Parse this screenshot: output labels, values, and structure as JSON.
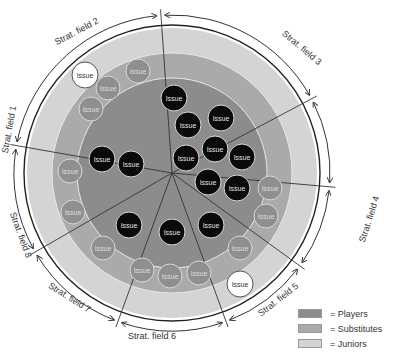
{
  "diagram": {
    "center": [
      172,
      173
    ],
    "rings": {
      "juniors_radius": 145,
      "substitutes_radius": 120,
      "players_radius": 95,
      "border_radius": 148,
      "arrow_radius": 158
    },
    "colors": {
      "players": "#8c8c8c",
      "substitutes": "#aaaaaa",
      "juniors": "#d4d4d4",
      "issue_player": "#0a0a0a",
      "issue_substitute": "#8f8f8f",
      "issue_junior": "#ffffff",
      "lines": "#333333"
    },
    "divider_angles_deg": [
      -94,
      -28,
      5,
      36,
      70,
      110,
      150,
      190
    ],
    "fields": [
      {
        "label": "Strat. field 1",
        "x": 12,
        "y": 130,
        "rotate": -80
      },
      {
        "label": "Strat. field 2",
        "x": 78,
        "y": 34,
        "rotate": -28
      },
      {
        "label": "Strat. field 3",
        "x": 300,
        "y": 50,
        "rotate": 40
      },
      {
        "label": "Strat. field 4",
        "x": 372,
        "y": 220,
        "rotate": -72
      },
      {
        "label": "Strat. field 5",
        "x": 280,
        "y": 302,
        "rotate": -38
      },
      {
        "label": "Strat. field 6",
        "x": 152,
        "y": 339,
        "rotate": 0
      },
      {
        "label": "Strat. field 7",
        "x": 68,
        "y": 300,
        "rotate": 32
      },
      {
        "label": "Strat. field 8",
        "x": 18,
        "y": 236,
        "rotate": 70
      }
    ],
    "issue_label": "Issue",
    "issues": [
      {
        "type": "junior",
        "x": 85,
        "y": 75,
        "r": 13
      },
      {
        "type": "substitute",
        "x": 108,
        "y": 88,
        "r": 12
      },
      {
        "type": "substitute",
        "x": 138,
        "y": 71,
        "r": 12
      },
      {
        "type": "substitute",
        "x": 91,
        "y": 109,
        "r": 12
      },
      {
        "type": "substitute",
        "x": 70,
        "y": 171,
        "r": 12
      },
      {
        "type": "substitute",
        "x": 73,
        "y": 212,
        "r": 12
      },
      {
        "type": "substitute",
        "x": 103,
        "y": 248,
        "r": 12
      },
      {
        "type": "substitute",
        "x": 142,
        "y": 270,
        "r": 12
      },
      {
        "type": "substitute",
        "x": 170,
        "y": 276,
        "r": 12
      },
      {
        "type": "substitute",
        "x": 199,
        "y": 273,
        "r": 12
      },
      {
        "type": "substitute",
        "x": 270,
        "y": 188,
        "r": 12
      },
      {
        "type": "substitute",
        "x": 266,
        "y": 216,
        "r": 12
      },
      {
        "type": "substitute",
        "x": 240,
        "y": 248,
        "r": 12
      },
      {
        "type": "junior",
        "x": 240,
        "y": 284,
        "r": 13
      },
      {
        "type": "player",
        "x": 174,
        "y": 98,
        "r": 13
      },
      {
        "type": "player",
        "x": 188,
        "y": 125,
        "r": 13
      },
      {
        "type": "player",
        "x": 221,
        "y": 118,
        "r": 13
      },
      {
        "type": "player",
        "x": 186,
        "y": 158,
        "r": 13
      },
      {
        "type": "player",
        "x": 215,
        "y": 149,
        "r": 13
      },
      {
        "type": "player",
        "x": 242,
        "y": 157,
        "r": 13
      },
      {
        "type": "player",
        "x": 208,
        "y": 182,
        "r": 13
      },
      {
        "type": "player",
        "x": 237,
        "y": 188,
        "r": 13
      },
      {
        "type": "player",
        "x": 102,
        "y": 159,
        "r": 13
      },
      {
        "type": "player",
        "x": 131,
        "y": 164,
        "r": 13
      },
      {
        "type": "player",
        "x": 129,
        "y": 225,
        "r": 13
      },
      {
        "type": "player",
        "x": 172,
        "y": 232,
        "r": 13
      },
      {
        "type": "player",
        "x": 211,
        "y": 225,
        "r": 13
      }
    ]
  },
  "legend": [
    {
      "key": "players",
      "label": "= Players",
      "color": "#8c8c8c"
    },
    {
      "key": "substitutes",
      "label": "= Substitutes",
      "color": "#aaaaaa"
    },
    {
      "key": "juniors",
      "label": "= Juniors",
      "color": "#d4d4d4"
    }
  ]
}
